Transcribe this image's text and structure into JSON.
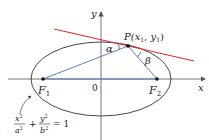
{
  "diagram": {
    "colors": {
      "axes": "#555555",
      "ellipse": "#333333",
      "focal_lines": "#4a6fb5",
      "tangent": "#e0262b",
      "text": "#222222"
    },
    "axes": {
      "x_label": "x",
      "y_label": "y",
      "origin_label": "0"
    },
    "foci": {
      "f1_main": "F",
      "f1_sub": "1",
      "f2_main": "F",
      "f2_sub": "2"
    },
    "point": {
      "label_main": "P(",
      "x_main": "x",
      "x_sub": "1",
      "comma": ", ",
      "y_main": "y",
      "y_sub": "1",
      "close": ")"
    },
    "angles": {
      "alpha": "α",
      "beta": "β"
    },
    "equation": {
      "x_num": "x",
      "x_exp": "2",
      "a_den": "a",
      "a_exp": "2",
      "plus": "+",
      "y_num": "y",
      "y_exp": "2",
      "b_den": "b",
      "b_exp": "2",
      "equals": "= 1"
    }
  }
}
